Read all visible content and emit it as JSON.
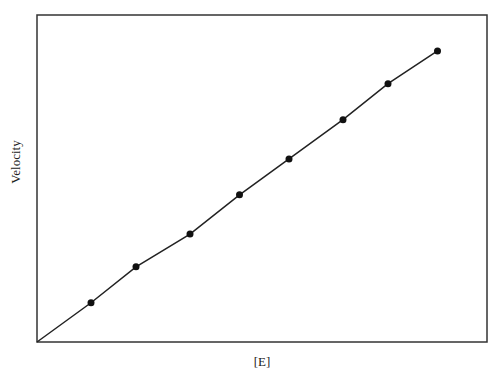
{
  "chart_data": {
    "type": "line",
    "title": "",
    "xlabel": "[E]",
    "ylabel": "Velocity",
    "x": [
      1.2,
      2.2,
      3.4,
      4.5,
      5.6,
      6.8,
      7.8,
      8.9
    ],
    "series": [
      {
        "name": "Velocity vs [E]",
        "values": [
          1.2,
          2.3,
          3.3,
          4.5,
          5.6,
          6.8,
          7.9,
          8.9
        ],
        "markers": true,
        "line_from_origin": true
      }
    ],
    "xlim": [
      0,
      10
    ],
    "ylim": [
      0,
      10
    ],
    "grid": false,
    "ticks": false,
    "legend": null
  },
  "style": {
    "line_color": "#222222",
    "marker_color": "#111111",
    "frame_color": "#333333"
  }
}
